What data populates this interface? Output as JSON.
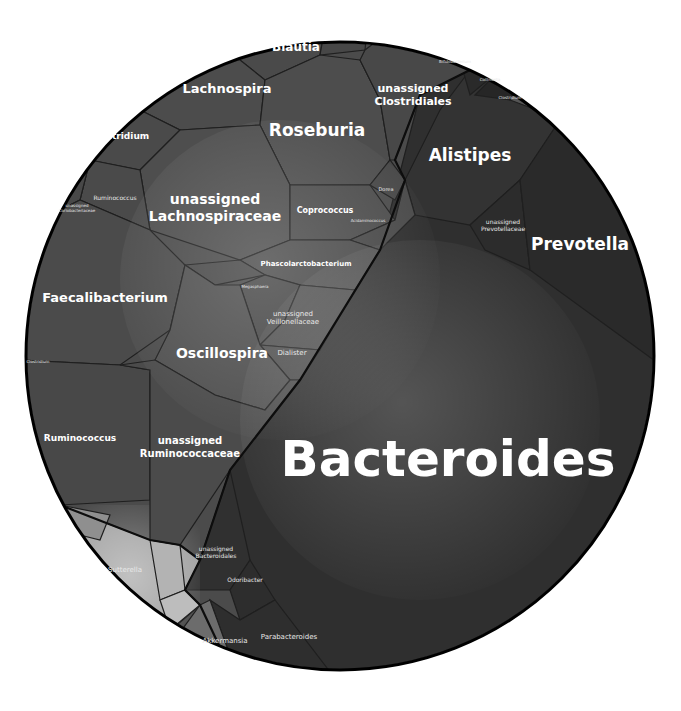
{
  "diagram": {
    "type": "voronoi-treemap",
    "circle": {
      "cx": 340,
      "cy": 356,
      "r": 314
    },
    "colors": {
      "firmicutes": "#4a4a4a",
      "bacteroidetes": "#2e2e2e",
      "proteobacteria": "#9a9a9a",
      "verrucomicrobia": "#6a6a6a",
      "actinobacteria": "#333333",
      "outline": "#0d0d0d",
      "label": "#ffffff"
    }
  },
  "labels": {
    "bacteroides": "Bacteroides",
    "prevotella": "Prevotella",
    "alistipes": "Alistipes",
    "unassigned_prevotellaceae": [
      "unassigned",
      "Prevotellaceae"
    ],
    "unassigned_bacteroidales": [
      "unassigned",
      "Bacteroidales"
    ],
    "odoribacter": "Odoribacter",
    "parabacteroides": "Parabacteroides",
    "akkermansia": "Akkermansia",
    "sutterella": "Sutterella",
    "roseburia": "Roseburia",
    "lachnospira": "Lachnospira",
    "blautia": "Blautia",
    "unassigned_clostridiales": [
      "unassigned",
      "Clostridiales"
    ],
    "clostridium_top": "Clostridium",
    "unassigned_lachnospiraceae": [
      "unassigned",
      "Lachnospiraceae"
    ],
    "coprococcus": "Coprococcus",
    "dorea": "Dorea",
    "acidaminococcus": "Acidaminococcus",
    "ruminococcus_small": "Ruminococcus",
    "unassigned_coriobacteriaceae": [
      "unassigned",
      "Coriobacteriaceae"
    ],
    "faecalibacterium": "Faecalibacterium",
    "phascolarctobacterium": "Phascolarctobacterium",
    "phyllobacterium_small": "Megasphaera",
    "unassigned_veillonellaceae": [
      "unassigned",
      "Veillonellaceae"
    ],
    "oscillospira": "Oscillospira",
    "dialister": "Dialister",
    "clostridium_left": "Clostridium",
    "ruminococcus": "Ruminococcus",
    "unassigned_ruminococcaceae": [
      "unassigned",
      "Ruminococcaceae"
    ],
    "bifidobacterium": "Bifidobacterium",
    "collinsella": "Collinsella",
    "clostridium_right": "Clostridium"
  }
}
